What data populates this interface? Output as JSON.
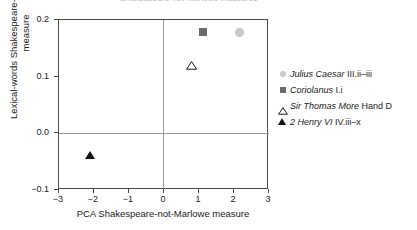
{
  "figure": {
    "title_sliver": "Shakespeare-not-Marlowe measures"
  },
  "chart_data": {
    "type": "scatter",
    "title": "",
    "xlabel": "PCA Shakespeare-not-Marlowe measure",
    "ylabel_line1": "Lexical-words Shakespeare-not-Marlowe",
    "ylabel_line2": "measure",
    "xlim": [
      -3,
      3
    ],
    "ylim": [
      -0.1,
      0.2
    ],
    "xticks": [
      "−3",
      "−2",
      "−1",
      "0",
      "1",
      "2",
      "3"
    ],
    "xtick_values": [
      -3,
      -2,
      -1,
      0,
      1,
      2,
      3
    ],
    "yticks": [
      "0.2",
      "0.1",
      "0.0",
      "−0.1"
    ],
    "ytick_values": [
      0.2,
      0.1,
      0.0,
      -0.1
    ],
    "grid": false,
    "reference_lines": [
      {
        "name": "x-zero",
        "axis": "vertical",
        "value": 0,
        "color": "#9a9a9a"
      },
      {
        "name": "y-zero",
        "axis": "horizontal",
        "value": 0.0,
        "color": "#9a9a9a"
      }
    ],
    "legend_position": "right",
    "series": [
      {
        "name": "Julius Caesar III.ii–iii",
        "label_italic": "Julius Caesar",
        "label_roman": "III.ii–iii",
        "marker": "circle",
        "color": "#c9c9c9",
        "filled": true,
        "x": [
          2.15
        ],
        "y": [
          0.178
        ]
      },
      {
        "name": "Coriolanus I.i",
        "label_italic": "Coriolanus",
        "label_roman": "I.i",
        "marker": "square",
        "color": "#6a6a6a",
        "filled": true,
        "x": [
          1.1
        ],
        "y": [
          0.178
        ]
      },
      {
        "name": "Sir Thomas More Hand D",
        "label_italic": "Sir Thomas More",
        "label_roman": "Hand D",
        "marker": "triangle-open",
        "color": "#1a1a1a",
        "filled": false,
        "x": [
          0.78
        ],
        "y": [
          0.127
        ]
      },
      {
        "name": "2 Henry VI IV.iii–x",
        "label_italic": "2 Henry VI",
        "label_roman": "IV.iii–x",
        "marker": "triangle-filled",
        "color": "#111111",
        "filled": true,
        "x": [
          -2.1
        ],
        "y": [
          -0.04
        ]
      }
    ]
  }
}
